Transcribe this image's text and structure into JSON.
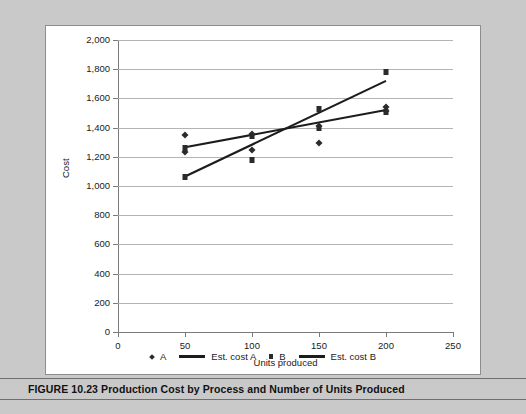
{
  "figure": {
    "caption_label": "FIGURE 10.23",
    "caption_title": "Production Cost by Process and Number of Units Produced",
    "caption_full": "FIGURE 10.23  Production Cost by Process and Number of Units Produced"
  },
  "colors": {
    "page_background": "#c9c9c9",
    "panel_background": "#ffffff",
    "panel_border": "#8d8d8d",
    "gridline": "#b4b4b4",
    "axis": "#7a7a7a",
    "marker": "#2b2b2b",
    "fit_line": "#1c1c1c",
    "caption_rule": "#6f6f6f",
    "text": "#1a1a1a"
  },
  "axis": {
    "y_ticks": [
      "0",
      "200",
      "400",
      "600",
      "800",
      "1,000",
      "1,200",
      "1,400",
      "1,600",
      "1,800",
      "2,000"
    ],
    "x_ticks": [
      "0",
      "50",
      "100",
      "150",
      "200",
      "250"
    ],
    "y_title": "Cost",
    "x_title": "Units produced"
  },
  "legend": {
    "entries": [
      {
        "label": "A",
        "marker": "diamond-marker-icon"
      },
      {
        "label": "Est. cost A",
        "marker": "line-swatch-icon"
      },
      {
        "label": "B",
        "marker": "square-marker-icon"
      },
      {
        "label": "Est. cost B",
        "marker": "line-swatch-icon"
      }
    ]
  },
  "chart_data": {
    "type": "scatter",
    "title": "Production Cost by Process and Number of Units Produced",
    "xlabel": "Units produced",
    "ylabel": "Cost",
    "xlim": [
      0,
      250
    ],
    "ylim": [
      0,
      2000
    ],
    "xticks": [
      0,
      50,
      100,
      150,
      200,
      250
    ],
    "yticks": [
      0,
      200,
      400,
      600,
      800,
      1000,
      1200,
      1400,
      1600,
      1800,
      2000
    ],
    "grid": "horizontal",
    "legend_position": "bottom",
    "series": [
      {
        "name": "A",
        "type": "scatter",
        "marker": "diamond",
        "points": [
          {
            "x": 50,
            "y": 1350
          },
          {
            "x": 50,
            "y": 1230
          },
          {
            "x": 100,
            "y": 1355
          },
          {
            "x": 100,
            "y": 1245
          },
          {
            "x": 150,
            "y": 1410
          },
          {
            "x": 150,
            "y": 1295
          },
          {
            "x": 200,
            "y": 1540
          },
          {
            "x": 200,
            "y": 1515
          }
        ]
      },
      {
        "name": "B",
        "type": "scatter",
        "marker": "square",
        "points": [
          {
            "x": 50,
            "y": 1260
          },
          {
            "x": 50,
            "y": 1065
          },
          {
            "x": 100,
            "y": 1340
          },
          {
            "x": 100,
            "y": 1180
          },
          {
            "x": 150,
            "y": 1530
          },
          {
            "x": 150,
            "y": 1400
          },
          {
            "x": 200,
            "y": 1780
          },
          {
            "x": 200,
            "y": 1510
          }
        ]
      },
      {
        "name": "Est. cost A",
        "type": "line",
        "points": [
          {
            "x": 50,
            "y": 1265
          },
          {
            "x": 200,
            "y": 1520
          }
        ]
      },
      {
        "name": "Est. cost B",
        "type": "line",
        "points": [
          {
            "x": 50,
            "y": 1065
          },
          {
            "x": 200,
            "y": 1720
          }
        ]
      }
    ]
  }
}
